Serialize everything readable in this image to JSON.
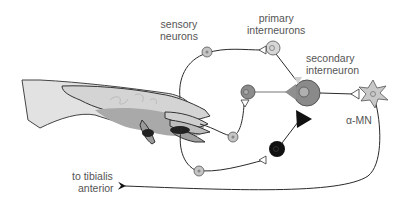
{
  "diagram": {
    "type": "neural-circuit",
    "labels": {
      "sensory": [
        "sensory",
        "neurons"
      ],
      "primary": [
        "primary",
        "interneurons"
      ],
      "secondary": [
        "secondary",
        "interneuron"
      ],
      "mn": "α-MN",
      "target": [
        "to tibialis",
        "anterior"
      ]
    },
    "colors": {
      "line": "#2a2a2a",
      "sensory_soma": "#c4c4c4",
      "primary_soma": "#d6d6d6",
      "secondary_soma": "#8a8a8a",
      "middle_soma": "#8c8c8c",
      "black_neuron": "#111111",
      "mn_soma": "#c8c8c8",
      "gray_synapse": "#8f8f8f",
      "light_synapse": "#cfcfcf",
      "hand_light": "#dcdcdc",
      "hand_mid": "#b8b8b8",
      "hand_dark": "#8e8e8e",
      "claw": "#222222"
    }
  }
}
